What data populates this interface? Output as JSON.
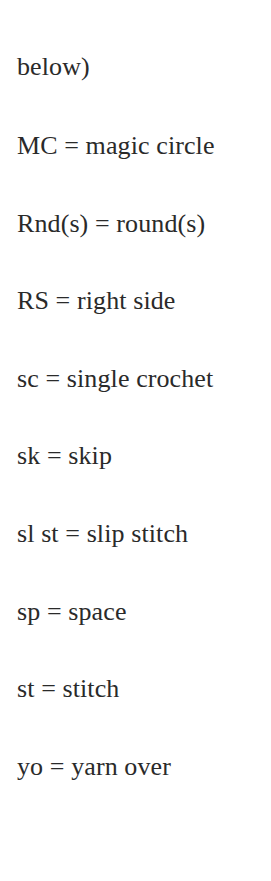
{
  "document": {
    "lines": [
      {
        "text": "below)"
      },
      {
        "text": "MC = magic circle",
        "abbr": "MC",
        "meaning": "magic circle"
      },
      {
        "text": "Rnd(s) = round(s)",
        "abbr": "Rnd(s)",
        "meaning": "round(s)"
      },
      {
        "text": "RS = right side",
        "abbr": "RS",
        "meaning": "right side"
      },
      {
        "text": "sc = single crochet",
        "abbr": "sc",
        "meaning": "single crochet"
      },
      {
        "text": "sk = skip",
        "abbr": "sk",
        "meaning": "skip"
      },
      {
        "text": "sl st = slip stitch",
        "abbr": "sl st",
        "meaning": "slip stitch"
      },
      {
        "text": "sp = space",
        "abbr": "sp",
        "meaning": "space"
      },
      {
        "text": "st = stitch",
        "abbr": "st",
        "meaning": "stitch"
      },
      {
        "text": "yo = yarn over",
        "abbr": "yo",
        "meaning": "yarn over"
      }
    ]
  },
  "colors": {
    "text": "#2a2a2a",
    "background": "#ffffff"
  }
}
